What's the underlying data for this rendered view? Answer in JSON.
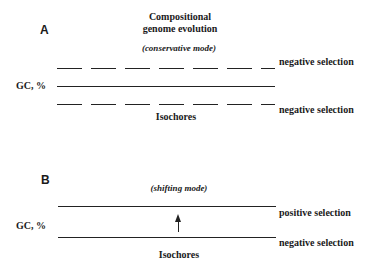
{
  "title": {
    "line1": "Compositional",
    "line2": "genome evolution"
  },
  "panel_a": {
    "letter": "A",
    "mode": "(conservative mode)",
    "y_label": "GC, %",
    "upper_label": "negative selection",
    "lower_label": "negative selection",
    "x_label": "Isochores"
  },
  "panel_b": {
    "letter": "B",
    "mode": "(shifting mode)",
    "y_label": "GC, %",
    "upper_label": "positive selection",
    "lower_label": "negative selection",
    "x_label": "Isochores",
    "arrow": "up-arrow"
  }
}
